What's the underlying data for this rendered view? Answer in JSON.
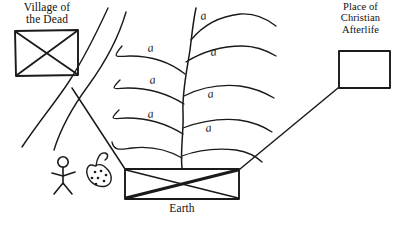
{
  "diagram": {
    "nodes": [
      {
        "id": "village-of-the-dead",
        "label": "Village of\nthe Dead",
        "shape": "rectangle-with-x",
        "x": 14,
        "y": 30,
        "w": 64,
        "h": 46
      },
      {
        "id": "place-of-christian-afterlife",
        "label": "Place of\nChristian\nAfterlife",
        "shape": "rectangle-empty",
        "x": 338,
        "y": 50,
        "w": 52,
        "h": 38
      },
      {
        "id": "earth",
        "label": "Earth",
        "shape": "rectangle-with-x",
        "x": 124,
        "y": 168,
        "w": 116,
        "h": 32
      }
    ],
    "edges": [
      {
        "id": "earth-to-village",
        "from": "earth",
        "to": "village-of-the-dead"
      },
      {
        "id": "earth-to-afterlife",
        "from": "earth",
        "to": "place-of-christian-afterlife"
      }
    ],
    "motifs": {
      "plant": {
        "name": "growing-plant",
        "branch_count": 7,
        "branch_glyph": "a"
      },
      "river": {
        "name": "river",
        "line_count": 2
      },
      "person": {
        "name": "stick-figure-person"
      },
      "seed_bag": {
        "name": "seed-bag",
        "seed_count": 7
      }
    },
    "colors": {
      "ink": "#1a1a1a",
      "paper": "#ffffff"
    }
  }
}
